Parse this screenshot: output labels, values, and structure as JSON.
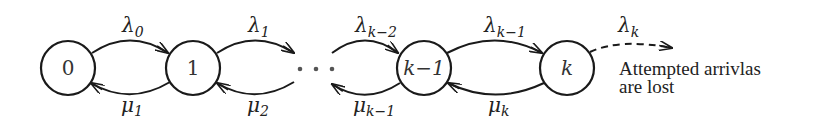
{
  "diagram": {
    "type": "birth-death state transition diagram",
    "nodes": [
      {
        "id": "0",
        "label": "0"
      },
      {
        "id": "1",
        "label": "1"
      },
      {
        "id": "k-1",
        "label": "k−1"
      },
      {
        "id": "k",
        "label": "k"
      }
    ],
    "ellipsis": "· · ·",
    "arrivals": [
      {
        "from": "0",
        "to": "1",
        "symbol": "λ",
        "sub": "0"
      },
      {
        "from": "1",
        "to": "…",
        "symbol": "λ",
        "sub": "1"
      },
      {
        "from": "…",
        "to": "k-1",
        "symbol": "λ",
        "sub": "k−2"
      },
      {
        "from": "k-1",
        "to": "k",
        "symbol": "λ",
        "sub": "k−1"
      },
      {
        "from": "k",
        "to": "lost",
        "symbol": "λ",
        "sub": "k",
        "dashed": true
      }
    ],
    "departures": [
      {
        "from": "1",
        "to": "0",
        "symbol": "μ",
        "sub": "1"
      },
      {
        "from": "…",
        "to": "1",
        "symbol": "μ",
        "sub": "2"
      },
      {
        "from": "k-1",
        "to": "…",
        "symbol": "μ",
        "sub": "k−1"
      },
      {
        "from": "k",
        "to": "k-1",
        "symbol": "μ",
        "sub": "k"
      }
    ],
    "note": {
      "line1": "Attempted arrivlas",
      "line2": "are lost"
    }
  }
}
